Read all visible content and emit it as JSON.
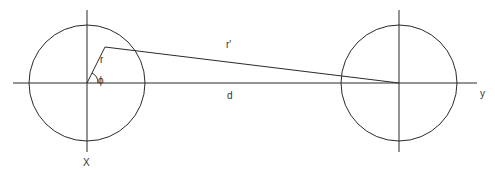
{
  "diagram": {
    "stroke_color": "#2a2a2a",
    "labels": {
      "r": "r",
      "phi": "ϕ",
      "r_prime": "r'",
      "d": "d",
      "x_axis": "X",
      "y_axis": "y"
    },
    "left_circle": {
      "cx": 87,
      "cy": 83,
      "r": 58
    },
    "right_circle": {
      "cx": 399,
      "cy": 83,
      "r": 58
    },
    "point": {
      "x": 105,
      "y": 47
    }
  }
}
